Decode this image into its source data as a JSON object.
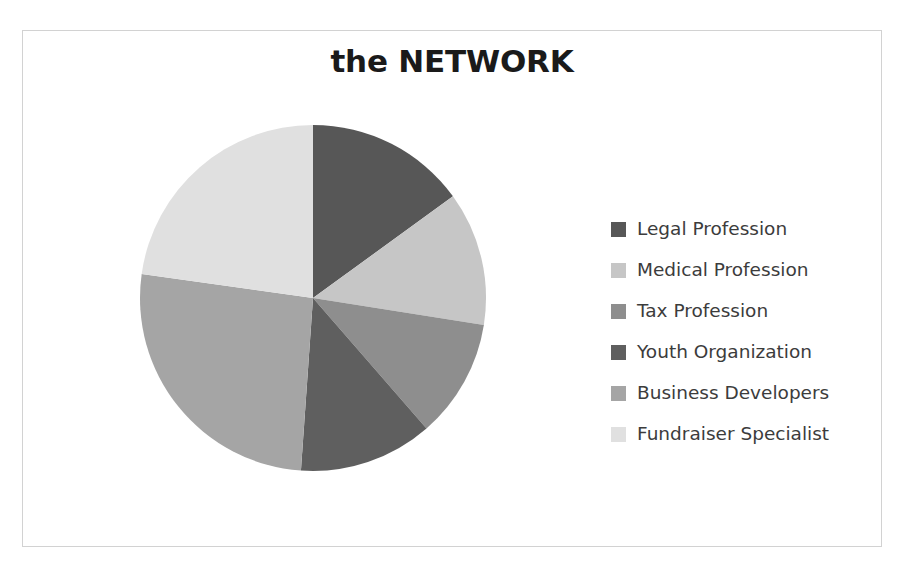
{
  "chart_data": {
    "type": "pie",
    "title": "the NETWORK",
    "legend_position": "right",
    "grid": false,
    "start_angle_deg": 0,
    "direction": "clockwise",
    "categories": [
      "Legal Profession",
      "Medical Profession",
      "Tax Profession",
      "Youth Organization",
      "Business Developers",
      "Fundraiser Specialist"
    ],
    "values": [
      15,
      12.5,
      11,
      12.5,
      26,
      23
    ],
    "value_unit": "percent",
    "angles_deg": [
      54,
      45,
      40,
      45,
      94,
      82
    ],
    "colors": [
      "#575757",
      "#c6c6c6",
      "#8e8e8e",
      "#5f5f5f",
      "#a5a5a5",
      "#e0e0e0"
    ],
    "series": [
      {
        "name": "the NETWORK",
        "values": [
          15,
          12.5,
          11,
          12.5,
          26,
          23
        ]
      }
    ]
  },
  "chart": {
    "title": "the NETWORK",
    "frame_border_color": "#d2d2d2",
    "background": "#ffffff"
  },
  "legend": {
    "items": [
      {
        "label": "Legal Profession",
        "color": "#575757"
      },
      {
        "label": "Medical Profession",
        "color": "#c6c6c6"
      },
      {
        "label": "Tax Profession",
        "color": "#8e8e8e"
      },
      {
        "label": "Youth Organization",
        "color": "#5f5f5f"
      },
      {
        "label": "Business Developers",
        "color": "#a5a5a5"
      },
      {
        "label": "Fundraiser Specialist",
        "color": "#e0e0e0"
      }
    ]
  }
}
